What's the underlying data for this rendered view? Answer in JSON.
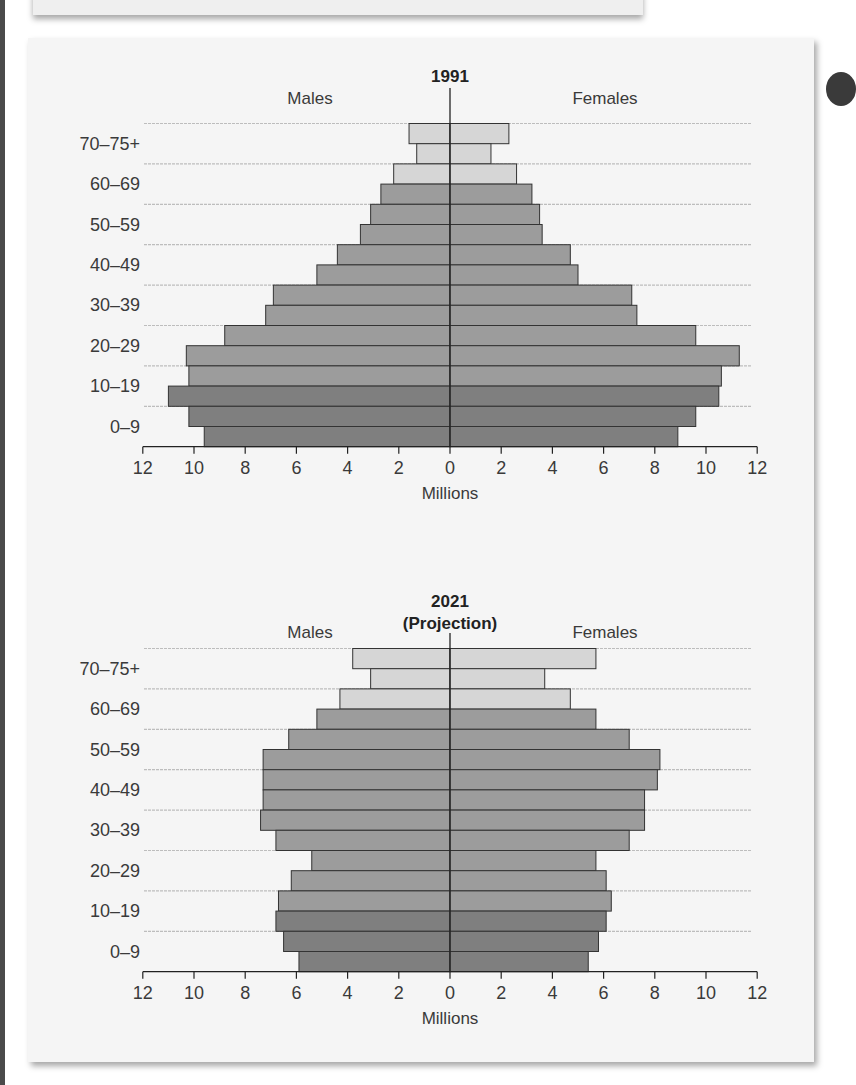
{
  "colors": {
    "light_bar": "#d6d6d6",
    "medium_bar": "#9c9c9c",
    "dark_bar": "#7f7f7f",
    "bar_outline": "#333333",
    "gridline": "#bdbdbd",
    "axis": "#222222",
    "text": "#3a3a3a",
    "card_bg": "#f5f5f5"
  },
  "chart_data": [
    {
      "type": "bar",
      "orientation": "horizontal-population-pyramid",
      "title": "1991",
      "subtitle": "",
      "left_label": "Males",
      "right_label": "Females",
      "xlabel": "Millions",
      "xticks": [
        "12",
        "10",
        "8",
        "6",
        "4",
        "2",
        "0",
        "2",
        "4",
        "6",
        "8",
        "10",
        "12"
      ],
      "xlim": [
        -12,
        12
      ],
      "age_labels_shown": [
        "70–75+",
        "60–69",
        "50–59",
        "40–49",
        "30–39",
        "20–29",
        "10–19",
        "0–9"
      ],
      "categories": [
        "75+",
        "70–74",
        "65–69",
        "60–64",
        "55–59",
        "50–54",
        "45–49",
        "40–44",
        "35–39",
        "30–34",
        "25–29",
        "20–24",
        "15–19",
        "10–14",
        "5–9",
        "0–4"
      ],
      "series": [
        {
          "name": "Males",
          "values": [
            1.6,
            1.3,
            2.2,
            2.7,
            3.1,
            3.5,
            4.4,
            5.2,
            6.9,
            7.2,
            8.8,
            10.3,
            10.2,
            11.0,
            10.2,
            9.6
          ]
        },
        {
          "name": "Females",
          "values": [
            2.3,
            1.6,
            2.6,
            3.2,
            3.5,
            3.6,
            4.7,
            5.0,
            7.1,
            7.3,
            9.6,
            11.3,
            10.6,
            10.5,
            9.6,
            8.9
          ]
        }
      ],
      "shade": [
        "light",
        "light",
        "light",
        "medium",
        "medium",
        "medium",
        "medium",
        "medium",
        "medium",
        "medium",
        "medium",
        "medium",
        "medium",
        "dark",
        "dark",
        "dark"
      ],
      "grid": true
    },
    {
      "type": "bar",
      "orientation": "horizontal-population-pyramid",
      "title": "2021",
      "subtitle": "(Projection)",
      "left_label": "Males",
      "right_label": "Females",
      "xlabel": "Millions",
      "xticks": [
        "12",
        "10",
        "8",
        "6",
        "4",
        "2",
        "0",
        "2",
        "4",
        "6",
        "8",
        "10",
        "12"
      ],
      "xlim": [
        -12,
        12
      ],
      "age_labels_shown": [
        "70–75+",
        "60–69",
        "50–59",
        "40–49",
        "30–39",
        "20–29",
        "10–19",
        "0–9"
      ],
      "categories": [
        "75+",
        "70–74",
        "65–69",
        "60–64",
        "55–59",
        "50–54",
        "45–49",
        "40–44",
        "35–39",
        "30–34",
        "25–29",
        "20–24",
        "15–19",
        "10–14",
        "5–9",
        "0–4"
      ],
      "series": [
        {
          "name": "Males",
          "values": [
            3.8,
            3.1,
            4.3,
            5.2,
            6.3,
            7.3,
            7.3,
            7.3,
            7.4,
            6.8,
            5.4,
            6.2,
            6.7,
            6.8,
            6.5,
            5.9
          ]
        },
        {
          "name": "Females",
          "values": [
            5.7,
            3.7,
            4.7,
            5.7,
            7.0,
            8.2,
            8.1,
            7.6,
            7.6,
            7.0,
            5.7,
            6.1,
            6.3,
            6.1,
            5.8,
            5.4
          ]
        }
      ],
      "shade": [
        "light",
        "light",
        "light",
        "medium",
        "medium",
        "medium",
        "medium",
        "medium",
        "medium",
        "medium",
        "medium",
        "medium",
        "medium",
        "dark",
        "dark",
        "dark"
      ],
      "grid": true
    }
  ],
  "charts": [
    {
      "title": "1991",
      "subtitle": "",
      "males": "Males",
      "females": "Females",
      "xlabel": "Millions"
    },
    {
      "title": "2021",
      "subtitle": "(Projection)",
      "males": "Males",
      "females": "Females",
      "xlabel": "Millions"
    }
  ]
}
